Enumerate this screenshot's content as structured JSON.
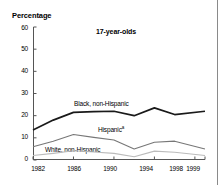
{
  "figure": {
    "ylabel": "Percentage",
    "title": "17-year-olds"
  },
  "axes": {
    "ytick_labels": [
      "60",
      "50",
      "40",
      "30",
      "20",
      "10",
      "0"
    ],
    "xtick_labels": [
      "1982",
      "1986",
      "1990",
      "1994",
      "1998",
      "1999"
    ]
  },
  "series_labels": {
    "black": "Black, non-Hispanic",
    "hispanic": "Hispanic",
    "hispanic_footnote": "a",
    "white": "White, non-Hispanic"
  },
  "colors": {
    "black_series": "#1a1a1a",
    "hispanic_series": "#777777",
    "white_series": "#bbbbbb",
    "axis": "#555555",
    "text": "#000000"
  },
  "chart_data": {
    "type": "line",
    "title": "17-year-olds",
    "xlabel": "",
    "ylabel": "Percentage",
    "ylim": [
      0,
      60
    ],
    "xlim": [
      1982,
      1999
    ],
    "grid": false,
    "legend": "inline-labels",
    "yticks": [
      0,
      10,
      20,
      30,
      40,
      50,
      60
    ],
    "xticks": [
      1982,
      1986,
      1990,
      1994,
      1998,
      1999
    ],
    "x": [
      1982,
      1984,
      1986,
      1988,
      1990,
      1992,
      1994,
      1996,
      1999
    ],
    "series": [
      {
        "name": "Black, non-Hispanic",
        "values": [
          13.5,
          18.0,
          21.5,
          21.8,
          22.0,
          20.0,
          23.5,
          20.5,
          22.0
        ]
      },
      {
        "name": "Hispanic",
        "values": [
          6.0,
          8.5,
          11.5,
          10.2,
          9.0,
          5.0,
          8.0,
          8.5,
          5.0
        ]
      },
      {
        "name": "White, non-Hispanic",
        "values": [
          2.0,
          3.0,
          4.2,
          3.6,
          3.0,
          1.5,
          4.0,
          3.5,
          2.0
        ]
      }
    ],
    "annotations": [
      {
        "text": "Black, non-Hispanic",
        "x": 1986.5,
        "y": 26
      },
      {
        "text": "Hispanic a",
        "x": 1990.5,
        "y": 13.5
      },
      {
        "text": "White, non-Hispanic",
        "x": 1983.5,
        "y": 3.5
      }
    ]
  }
}
